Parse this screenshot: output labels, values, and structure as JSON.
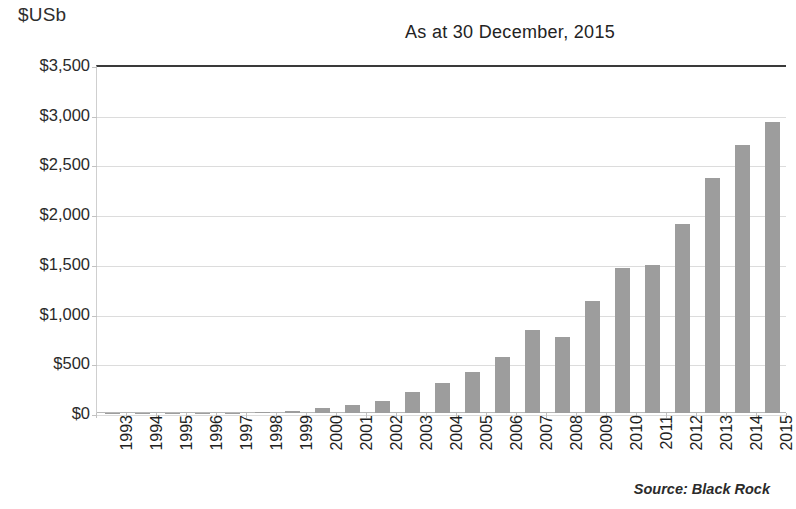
{
  "chart_data": {
    "type": "bar",
    "title": "As at 30 December, 2015",
    "xlabel": "",
    "ylabel": "$USb",
    "ylim": [
      0,
      3500
    ],
    "ytick_values": [
      0,
      500,
      1000,
      1500,
      2000,
      2500,
      3000,
      3500
    ],
    "ytick_labels": [
      "$0",
      "$500",
      "$1,000",
      "$1,500",
      "$2,000",
      "$2,500",
      "$3,000",
      "$3,500"
    ],
    "grid": true,
    "legend": "none",
    "bar_color": "#9d9d9d",
    "categories": [
      "1993",
      "1994",
      "1995",
      "1996",
      "1997",
      "1998",
      "1999",
      "2000",
      "2001",
      "2002",
      "2003",
      "2004",
      "2005",
      "2006",
      "2007",
      "2008",
      "2009",
      "2010",
      "2011",
      "2012",
      "2013",
      "2014",
      "2015"
    ],
    "values": [
      1,
      2,
      2,
      3,
      5,
      10,
      20,
      55,
      80,
      120,
      210,
      300,
      410,
      565,
      830,
      760,
      1130,
      1460,
      1490,
      1900,
      2360,
      2700,
      2930
    ],
    "source": "Source: Black Rock"
  },
  "figure": {
    "y_axis_unit": "$USb",
    "title": "As at 30 December, 2015",
    "source_note": "Source: Black Rock"
  }
}
